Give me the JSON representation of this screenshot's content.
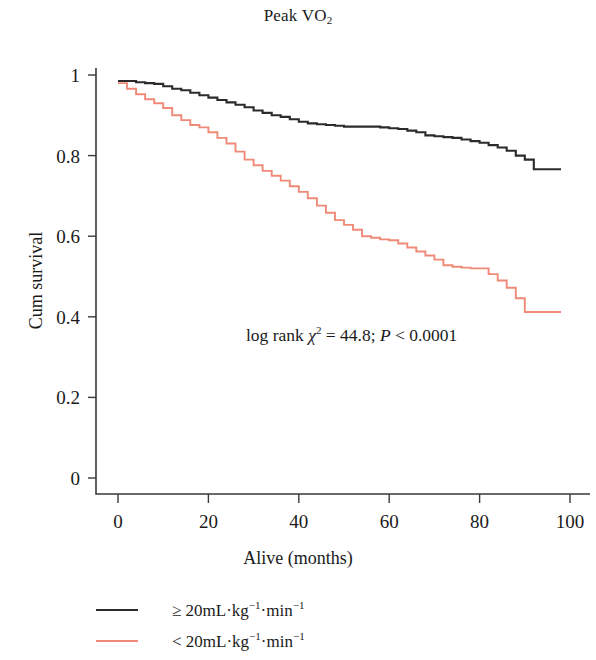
{
  "chart_data": {
    "type": "line",
    "subtype": "kaplan-meier-step",
    "title": "Peak VO2",
    "title_base": "Peak VO",
    "title_sub": "2",
    "xlabel": "Alive (months)",
    "ylabel": "Cum survival",
    "xlim": [
      0,
      102
    ],
    "ylim": [
      0,
      1.04
    ],
    "xticks": [
      0,
      20,
      40,
      60,
      80,
      100
    ],
    "xticklabels": [
      "0",
      "20",
      "40",
      "60",
      "80",
      "100"
    ],
    "yticks": [
      0,
      0.2,
      0.4,
      0.6,
      0.8,
      1
    ],
    "yticklabels": [
      "0",
      "0.2",
      "0.4",
      "0.6",
      "0.8",
      "1"
    ],
    "grid": false,
    "legend_position": "below-left",
    "annotation": {
      "prefix": "log rank ",
      "chi": "χ",
      "chi_sup": "2",
      "middle": " = 44.8; ",
      "p": "P",
      "suffix": " < 0.0001",
      "full_text": "log rank χ2 = 44.8; P < 0.0001"
    },
    "series": [
      {
        "name": "≥ 20mL·kg−1·min−1",
        "legend_label_base": "≥ 20mL·kg",
        "legend_sup_1": "−1",
        "legend_label_mid": "·min",
        "legend_sup_2": "−1",
        "color": "#2b2b2b",
        "x": [
          0,
          2,
          4,
          6,
          8,
          10,
          12,
          14,
          16,
          18,
          20,
          22,
          24,
          26,
          28,
          30,
          32,
          34,
          36,
          38,
          40,
          42,
          44,
          46,
          48,
          50,
          52,
          54,
          56,
          58,
          60,
          62,
          64,
          66,
          68,
          70,
          72,
          74,
          76,
          78,
          80,
          82,
          84,
          86,
          88,
          90,
          92,
          98
        ],
        "y": [
          0.985,
          0.985,
          0.982,
          0.98,
          0.978,
          0.972,
          0.966,
          0.962,
          0.956,
          0.95,
          0.944,
          0.938,
          0.932,
          0.926,
          0.92,
          0.912,
          0.906,
          0.9,
          0.896,
          0.89,
          0.884,
          0.88,
          0.878,
          0.876,
          0.874,
          0.872,
          0.872,
          0.872,
          0.872,
          0.87,
          0.868,
          0.866,
          0.862,
          0.858,
          0.85,
          0.848,
          0.846,
          0.844,
          0.84,
          0.836,
          0.832,
          0.826,
          0.82,
          0.812,
          0.8,
          0.79,
          0.766,
          0.766
        ]
      },
      {
        "name": "< 20mL·kg−1·min−1",
        "legend_label_base": "< 20mL·kg",
        "legend_sup_1": "−1",
        "legend_label_mid": "·min",
        "legend_sup_2": "−1",
        "color": "#f08a78",
        "x": [
          0,
          2,
          4,
          6,
          8,
          10,
          12,
          14,
          16,
          18,
          20,
          22,
          24,
          26,
          28,
          30,
          32,
          34,
          36,
          38,
          40,
          42,
          44,
          46,
          48,
          50,
          52,
          54,
          56,
          58,
          60,
          62,
          64,
          66,
          68,
          70,
          72,
          74,
          76,
          78,
          80,
          82,
          84,
          86,
          88,
          90,
          98
        ],
        "y": [
          0.98,
          0.966,
          0.952,
          0.94,
          0.93,
          0.918,
          0.9,
          0.888,
          0.876,
          0.87,
          0.858,
          0.844,
          0.83,
          0.81,
          0.79,
          0.776,
          0.762,
          0.75,
          0.738,
          0.724,
          0.71,
          0.694,
          0.676,
          0.658,
          0.64,
          0.628,
          0.616,
          0.6,
          0.596,
          0.592,
          0.59,
          0.582,
          0.572,
          0.562,
          0.552,
          0.542,
          0.528,
          0.524,
          0.522,
          0.52,
          0.52,
          0.506,
          0.49,
          0.472,
          0.446,
          0.412,
          0.412
        ]
      }
    ]
  },
  "figure": {
    "background": "#ffffff",
    "axis_color": "#3a3a3a"
  }
}
